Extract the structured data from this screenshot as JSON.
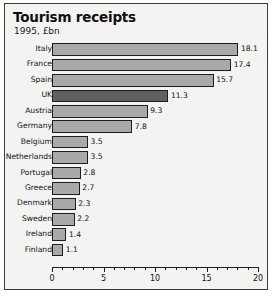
{
  "chart_data": {
    "type": "bar",
    "orientation": "horizontal",
    "title": "Tourism receipts",
    "subtitle": "1995, £bn",
    "xlabel": "",
    "ylabel": "",
    "xlim": [
      0,
      20
    ],
    "xticks": [
      0,
      5,
      10,
      15,
      20
    ],
    "xticklabels": [
      "0",
      "5",
      "10",
      "15",
      "20"
    ],
    "minor_tick_step": 1,
    "grid": false,
    "legend": "none",
    "categories": [
      "Italy",
      "France",
      "Spain",
      "UK",
      "Austria",
      "Germany",
      "Belgium",
      "Netherlands",
      "Portugal",
      "Greece",
      "Denmark",
      "Sweden",
      "Ireland",
      "Finland"
    ],
    "values": [
      18.1,
      17.4,
      15.7,
      11.3,
      9.3,
      7.8,
      3.5,
      3.5,
      2.8,
      2.7,
      2.3,
      2.2,
      1.4,
      1.1
    ],
    "value_labels": [
      "18.1",
      "17.4",
      "15.7",
      "11.3",
      "9.3",
      "7.8",
      "3.5",
      "3.5",
      "2.8",
      "2.7",
      "2.3",
      "2.2",
      "1.4",
      "1.1"
    ],
    "highlighted": [
      "UK"
    ],
    "colors": {
      "bar": "#a9a9a9",
      "bar_highlight": "#606060",
      "bar_border": "#1d1d1d",
      "background": "#f3f3f1",
      "frame": "#3a3a3a",
      "text": "#111111"
    }
  }
}
